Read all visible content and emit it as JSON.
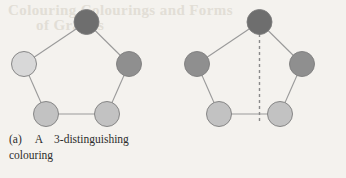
{
  "page": {
    "background_color": "#f4f2ee",
    "bleed_through_text": {
      "line1": "Colouring Colourings and Forms",
      "line2": "of Graphs"
    }
  },
  "palette": {
    "dark": "#6e6e6e",
    "medium_dark": "#8f8f8f",
    "medium_light": "#c2c2c2",
    "light": "#d8d8d8",
    "edge": "#9a9a9a",
    "node_stroke": "#7d7d7d",
    "dashed_axis": "#8a8a8a",
    "text": "#2c2c2c"
  },
  "figures": [
    {
      "id": "figure-a",
      "tag": "(a)",
      "caption_line1_a": "A",
      "caption_line1_b": "3-distinguishing",
      "caption_line2": "colouring",
      "caption_full": "(a)  A  3-distinguishing colouring",
      "graph": {
        "type": "pentagon-cycle",
        "vertex_count": 5,
        "has_symmetry_axis": false,
        "vertices": [
          {
            "name": "top",
            "cx": 86.5,
            "cy": 22,
            "r": 12.5,
            "color": "#6e6e6e",
            "color_name": "dark"
          },
          {
            "name": "upper-left",
            "cx": 24,
            "cy": 64,
            "r": 12.5,
            "color": "#d8d8d8",
            "color_name": "light"
          },
          {
            "name": "upper-right",
            "cx": 129,
            "cy": 64,
            "r": 12.5,
            "color": "#8f8f8f",
            "color_name": "medium-dark"
          },
          {
            "name": "bottom-left",
            "cx": 46,
            "cy": 114,
            "r": 12.5,
            "color": "#c2c2c2",
            "color_name": "medium-light"
          },
          {
            "name": "bottom-right",
            "cx": 107,
            "cy": 114,
            "r": 12.5,
            "color": "#c2c2c2",
            "color_name": "medium-light"
          }
        ],
        "edges": [
          [
            "top",
            "upper-left"
          ],
          [
            "top",
            "upper-right"
          ],
          [
            "upper-left",
            "bottom-left"
          ],
          [
            "upper-right",
            "bottom-right"
          ],
          [
            "bottom-left",
            "bottom-right"
          ]
        ]
      }
    },
    {
      "id": "figure-b",
      "tag": "(b)",
      "caption_line1_a": "A",
      "caption_line1_b": "non-distinguishing",
      "caption_line2": "colouring",
      "caption_full": "(b) A non-distinguishing colouring",
      "graph": {
        "type": "pentagon-cycle",
        "vertex_count": 5,
        "has_symmetry_axis": true,
        "symmetry_axis": {
          "x": 86.5,
          "y1": 22,
          "y2": 124,
          "style": "dashed"
        },
        "vertices": [
          {
            "name": "top",
            "cx": 86.5,
            "cy": 22,
            "r": 12.5,
            "color": "#6e6e6e",
            "color_name": "dark"
          },
          {
            "name": "upper-left",
            "cx": 24,
            "cy": 64,
            "r": 12.5,
            "color": "#8f8f8f",
            "color_name": "medium-dark"
          },
          {
            "name": "upper-right",
            "cx": 129,
            "cy": 64,
            "r": 12.5,
            "color": "#8f8f8f",
            "color_name": "medium-dark"
          },
          {
            "name": "bottom-left",
            "cx": 46,
            "cy": 114,
            "r": 12.5,
            "color": "#c2c2c2",
            "color_name": "medium-light"
          },
          {
            "name": "bottom-right",
            "cx": 107,
            "cy": 114,
            "r": 12.5,
            "color": "#c2c2c2",
            "color_name": "medium-light"
          }
        ],
        "edges": [
          [
            "top",
            "upper-left"
          ],
          [
            "top",
            "upper-right"
          ],
          [
            "upper-left",
            "bottom-left"
          ],
          [
            "upper-right",
            "bottom-right"
          ],
          [
            "bottom-left",
            "bottom-right"
          ]
        ]
      }
    }
  ]
}
